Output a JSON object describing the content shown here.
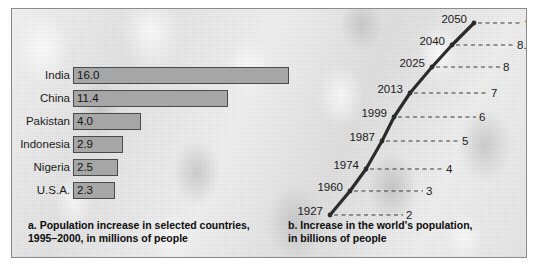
{
  "figure": {
    "panel_a": {
      "caption_line1": "a. Population increase in selected countries,",
      "caption_line2": "1995–2000, in millions of people"
    },
    "panel_b": {
      "caption_line1": "b. Increase in the world's population,",
      "caption_line2": "in billions of people"
    }
  },
  "colors": {
    "bar_fill": "#a6a6a6",
    "bar_stroke": "#4a4a4a",
    "line_stroke": "#2b2b2b",
    "dash_stroke": "#3a3a3a",
    "frame": "#8a8a8a"
  },
  "chart_data": [
    {
      "type": "bar",
      "title": "a. Population increase in selected countries, 1995–2000, in millions of people",
      "orientation": "horizontal",
      "xlabel": "",
      "ylabel": "",
      "categories": [
        "India",
        "China",
        "Pakistan",
        "Indonesia",
        "Nigeria",
        "U.S.A."
      ],
      "values": [
        16.0,
        11.4,
        4.0,
        2.9,
        2.5,
        2.3
      ],
      "value_labels": [
        "16.0",
        "11.4",
        "4.0",
        "2.9",
        "2.5",
        "2.3"
      ],
      "units": "millions of people",
      "xlim": [
        0,
        16.0
      ],
      "grid": false,
      "legend": "none"
    },
    {
      "type": "line",
      "title": "b. Increase in the world's population, in billions of people",
      "xlabel": "",
      "ylabel": "",
      "units": "billions of people",
      "x": [
        "1927",
        "1960",
        "1974",
        "1987",
        "1999",
        "2013",
        "2025",
        "2040",
        "2050"
      ],
      "values": [
        2,
        3,
        4,
        5,
        6,
        7,
        8,
        8.8,
        9.15
      ],
      "value_labels": [
        "2",
        "3",
        "4",
        "5",
        "6",
        "7",
        "8",
        "8.8",
        "9.15"
      ],
      "ylim": [
        2,
        9.15
      ],
      "grid": false,
      "legend": "none",
      "annotation": "Each point is labelled with its year on the left and its population value on the right via a dashed leader line."
    }
  ],
  "line_points": [
    {
      "year": "1927",
      "value": "2",
      "x": 60,
      "y": 206,
      "dash_end": 133
    },
    {
      "year": "1960",
      "value": "3",
      "x": 80,
      "y": 182,
      "dash_end": 153
    },
    {
      "year": "1974",
      "value": "4",
      "x": 96,
      "y": 160,
      "dash_end": 173
    },
    {
      "year": "1987",
      "value": "5",
      "x": 112,
      "y": 132,
      "dash_end": 189
    },
    {
      "year": "1999",
      "value": "6",
      "x": 124,
      "y": 108,
      "dash_end": 206
    },
    {
      "year": "2013",
      "value": "7",
      "x": 140,
      "y": 84,
      "dash_end": 218
    },
    {
      "year": "2025",
      "value": "8",
      "x": 162,
      "y": 58,
      "dash_end": 230
    },
    {
      "year": "2040",
      "value": "8.8",
      "x": 182,
      "y": 36,
      "dash_end": 244
    },
    {
      "year": "2050",
      "value": "9.15",
      "x": 204,
      "y": 14,
      "dash_end": 252
    }
  ],
  "bar_rows": [
    {
      "label": "India",
      "value": "16.0",
      "width": 216
    },
    {
      "label": "China",
      "value": "11.4",
      "width": 155
    },
    {
      "label": "Pakistan",
      "value": "4.0",
      "width": 68
    },
    {
      "label": "Indonesia",
      "value": "2.9",
      "width": 50
    },
    {
      "label": "Nigeria",
      "value": "2.5",
      "width": 45
    },
    {
      "label": "U.S.A.",
      "value": "2.3",
      "width": 42
    }
  ]
}
